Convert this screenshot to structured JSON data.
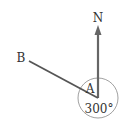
{
  "diagram": {
    "type": "bearing",
    "labels": {
      "north": "N",
      "start_point": "B",
      "vertex": "A",
      "angle": "300°"
    },
    "bearing_degrees": 300,
    "colors": {
      "line": "#555555",
      "arrow": "#666666",
      "circle": "#888888",
      "text": "#333333"
    }
  }
}
